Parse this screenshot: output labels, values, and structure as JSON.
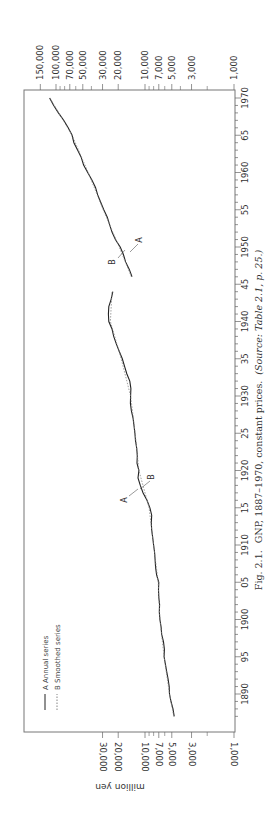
{
  "chart_data": {
    "type": "line",
    "orientation": "rotated-90-clockwise",
    "title": "Fig. 2.1. GNP, 1887–1970, constant prices.",
    "source_note": "(Source: Table 2.1, p. 25.)",
    "xlabel": "",
    "ylabel": "million yen",
    "yscale": "log",
    "ylim": [
      1000,
      150000
    ],
    "xlim": [
      1886,
      1970
    ],
    "x_ticks": [
      "1890",
      "95",
      "1900",
      "05",
      "1910",
      "15",
      "1920",
      "25",
      "1930",
      "35",
      "1940",
      "45",
      "1950",
      "55",
      "1960",
      "65",
      "1970"
    ],
    "y_ticks_left": [
      "30,000",
      "20,000",
      "10,000",
      "7,000",
      "5,000",
      "3,000",
      "1,000"
    ],
    "y_ticks_right": [
      "150,000",
      "100,000",
      "70,000",
      "50,000",
      "30,000",
      "20,000",
      "10,000",
      "7,000",
      "5,000",
      "3,000",
      "1,000"
    ],
    "legend": [
      {
        "key": "A",
        "label": "Annual series",
        "style": "solid"
      },
      {
        "key": "B",
        "label": "Smoothed series",
        "style": "dashed"
      }
    ],
    "annotations": [
      {
        "text": "A",
        "near_year": 1918
      },
      {
        "text": "B",
        "near_year": 1920
      },
      {
        "text": "B",
        "near_year": 1950
      },
      {
        "text": "A",
        "near_year": 1951
      }
    ],
    "series": [
      {
        "name": "A Annual series",
        "segments": [
          {
            "x": [
              1887,
              1888,
              1889,
              1890,
              1891,
              1892,
              1893,
              1894,
              1895,
              1896,
              1897,
              1898,
              1899,
              1900,
              1901,
              1902,
              1903,
              1904,
              1905,
              1906,
              1907,
              1908,
              1909,
              1910,
              1911,
              1912,
              1913,
              1914,
              1915,
              1916,
              1917,
              1918,
              1919,
              1920,
              1921,
              1922,
              1923,
              1924,
              1925,
              1926,
              1927,
              1928,
              1929,
              1930,
              1931,
              1932,
              1933,
              1934,
              1935,
              1936,
              1937,
              1938,
              1939,
              1940,
              1941,
              1942,
              1943,
              1944
            ],
            "y": [
              4700,
              4850,
              5100,
              5300,
              5350,
              5500,
              5700,
              5900,
              6100,
              6050,
              6200,
              6500,
              6600,
              6800,
              6900,
              6850,
              7000,
              7050,
              7000,
              7400,
              7600,
              7700,
              7800,
              8000,
              8200,
              8400,
              8500,
              8400,
              8800,
              9500,
              10500,
              11300,
              12000,
              11700,
              12300,
              12200,
              12400,
              12800,
              13000,
              13300,
              13600,
              14200,
              14600,
              14500,
              14400,
              14800,
              16000,
              17000,
              18000,
              19500,
              21000,
              22500,
              23500,
              25500,
              25800,
              25500,
              24000,
              23000
            ]
          },
          {
            "x": [
              1946,
              1947,
              1948,
              1949,
              1950,
              1951,
              1952,
              1953,
              1954,
              1955,
              1956,
              1957,
              1958,
              1959,
              1960,
              1961,
              1962,
              1963,
              1964,
              1965,
              1966,
              1967,
              1968,
              1969,
              1970
            ],
            "y": [
              14000,
              15000,
              16500,
              17500,
              19000,
              21500,
              23500,
              25000,
              26500,
              29000,
              31500,
              34000,
              36000,
              39500,
              44000,
              49000,
              52000,
              57000,
              63000,
              66000,
              73000,
              82000,
              94000,
              106000,
              118000
            ]
          }
        ]
      },
      {
        "name": "B Smoothed series",
        "segments": [
          {
            "x": [
              1887,
              1890,
              1895,
              1900,
              1905,
              1910,
              1915,
              1920,
              1925,
              1930,
              1935,
              1940,
              1944
            ],
            "y": [
              4750,
              5300,
              6100,
              6800,
              7100,
              8000,
              9000,
              11700,
              12900,
              14500,
              18500,
              24500,
              23500
            ]
          },
          {
            "x": [
              1946,
              1950,
              1955,
              1960,
              1965,
              1970
            ],
            "y": [
              14200,
              19500,
              29500,
              43500,
              66000,
              117000
            ]
          }
        ]
      }
    ]
  },
  "labels": {
    "caption_fig": "Fig. 2.1.",
    "caption_text": "GNP, 1887–1970, constant prices.",
    "caption_source": "(Source: Table 2.1, p. 25.)",
    "axis_unit": "million yen",
    "legend_a": "A  Annual series",
    "legend_b": "B  Smoothed series"
  }
}
